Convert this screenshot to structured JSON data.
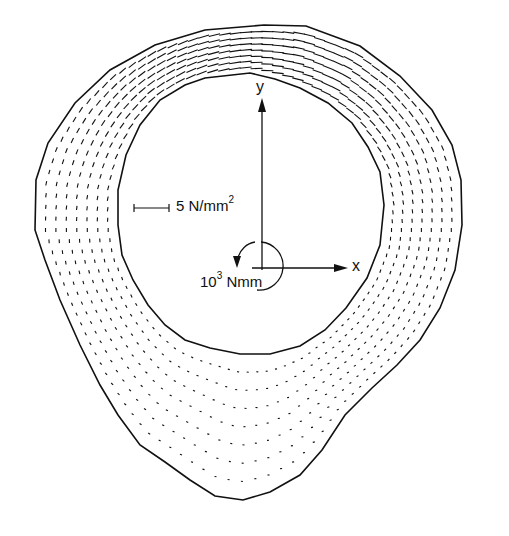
{
  "diagram": {
    "type": "stress distribution in annular cross-section",
    "stroke_color": "#111111",
    "background": "#ffffff",
    "outer_boundary": [
      [
        264,
        25
      ],
      [
        306,
        26
      ],
      [
        360,
        46
      ],
      [
        400,
        76
      ],
      [
        432,
        110
      ],
      [
        452,
        145
      ],
      [
        461,
        180
      ],
      [
        462,
        225
      ],
      [
        455,
        270
      ],
      [
        440,
        308
      ],
      [
        420,
        340
      ],
      [
        397,
        365
      ],
      [
        372,
        388
      ],
      [
        345,
        415
      ],
      [
        322,
        450
      ],
      [
        300,
        475
      ],
      [
        270,
        492
      ],
      [
        243,
        500
      ],
      [
        215,
        496
      ],
      [
        190,
        480
      ],
      [
        165,
        462
      ],
      [
        140,
        445
      ],
      [
        118,
        415
      ],
      [
        100,
        385
      ],
      [
        80,
        345
      ],
      [
        60,
        300
      ],
      [
        45,
        260
      ],
      [
        35,
        230
      ],
      [
        36,
        180
      ],
      [
        48,
        143
      ],
      [
        75,
        103
      ],
      [
        110,
        70
      ],
      [
        155,
        45
      ],
      [
        205,
        30
      ]
    ],
    "inner_boundary": [
      [
        232,
        75
      ],
      [
        250,
        73
      ],
      [
        275,
        79
      ],
      [
        300,
        88
      ],
      [
        328,
        103
      ],
      [
        352,
        123
      ],
      [
        368,
        147
      ],
      [
        380,
        172
      ],
      [
        384,
        205
      ],
      [
        380,
        245
      ],
      [
        367,
        278
      ],
      [
        346,
        308
      ],
      [
        325,
        330
      ],
      [
        300,
        346
      ],
      [
        270,
        354
      ],
      [
        240,
        354
      ],
      [
        210,
        348
      ],
      [
        185,
        340
      ],
      [
        165,
        325
      ],
      [
        148,
        305
      ],
      [
        133,
        280
      ],
      [
        122,
        255
      ],
      [
        118,
        225
      ],
      [
        118,
        190
      ],
      [
        126,
        155
      ],
      [
        140,
        125
      ],
      [
        160,
        100
      ],
      [
        185,
        85
      ],
      [
        205,
        78
      ]
    ],
    "layers": 7
  },
  "scale_bar": {
    "label": "5 N/mm",
    "superscript": "2"
  },
  "axes": {
    "x_label": "x",
    "y_label": "y"
  },
  "moment": {
    "label_prefix": "10",
    "exponent": "3",
    "label_unit": " Nmm"
  }
}
